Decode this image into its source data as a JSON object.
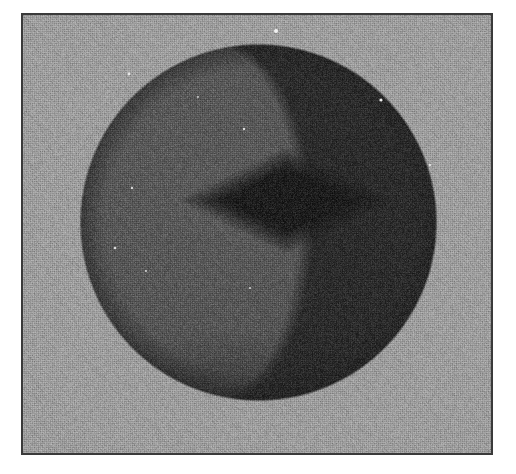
{
  "figure": {
    "domain_kind": "scanned-raster-figure",
    "caption": "",
    "subject_label": "shaded faceted sphere",
    "media": "halftone scan, grayscale",
    "canvas": {
      "width": 516,
      "height": 474,
      "page_background": "#ffffff"
    },
    "plate": {
      "x": 21,
      "y": 13,
      "width": 472,
      "height": 442,
      "background_gray": "#9b9b9b",
      "border_color": "#3a3a3a",
      "border_width": 2
    },
    "sphere": {
      "center_x": 258,
      "center_y": 222,
      "radius": 178,
      "facet_rings": 7,
      "facet_meridians": 12,
      "base_gray": "#4e4e4e",
      "light_gray": "#585858",
      "shadow_gray": "#2b2b2b",
      "terminator_x_offset": 128,
      "silhouette_edge_gray": "#232323"
    },
    "center_feature": {
      "shape": "diamond",
      "label": "dark rhombic depression",
      "center_x": 286,
      "center_y": 200,
      "half_width": 82,
      "half_height": 40,
      "core_gray": "#1b1b1b",
      "halo_gray": "#3a3a3a"
    },
    "speckles": [
      {
        "x": 276,
        "y": 31,
        "r": 2.0,
        "gray": "#f2f2f2"
      },
      {
        "x": 129,
        "y": 74,
        "r": 1.4,
        "gray": "#e8e8e8"
      },
      {
        "x": 381,
        "y": 100,
        "r": 1.6,
        "gray": "#ededed"
      },
      {
        "x": 244,
        "y": 129,
        "r": 1.2,
        "gray": "#dedede"
      },
      {
        "x": 132,
        "y": 188,
        "r": 1.2,
        "gray": "#d8d8d8"
      },
      {
        "x": 115,
        "y": 248,
        "r": 1.3,
        "gray": "#dcdcdc"
      },
      {
        "x": 146,
        "y": 271,
        "r": 1.1,
        "gray": "#d2d2d2"
      },
      {
        "x": 250,
        "y": 288,
        "r": 1.1,
        "gray": "#cfcfcf"
      },
      {
        "x": 430,
        "y": 165,
        "r": 1.2,
        "gray": "#e0e0e0"
      },
      {
        "x": 198,
        "y": 97,
        "r": 1.0,
        "gray": "#cdcdcd"
      }
    ]
  }
}
